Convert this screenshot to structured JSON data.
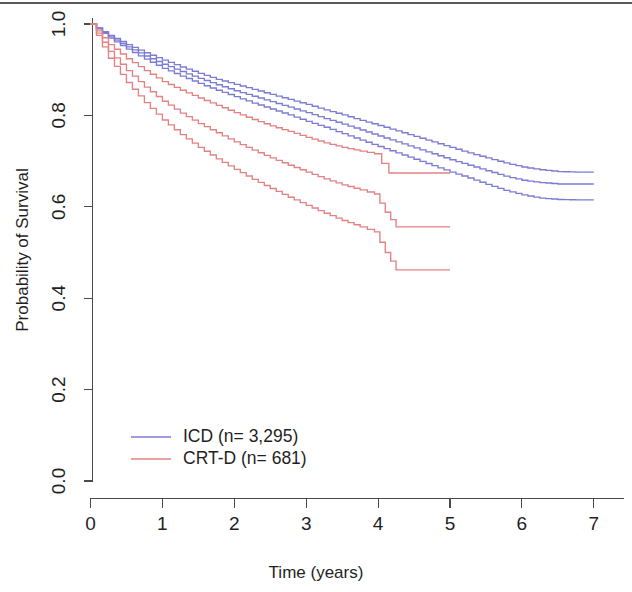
{
  "figure": {
    "title": "",
    "background": "#ffffff"
  },
  "axes": {
    "x_title": "Time (years)",
    "y_title": "Probability of Survival",
    "x_ticks": [
      "0",
      "1",
      "2",
      "3",
      "4",
      "5",
      "6",
      "7"
    ],
    "y_ticks": [
      "0.0",
      "0.2",
      "0.4",
      "0.6",
      "0.8",
      "1.0"
    ]
  },
  "legend": {
    "items": [
      {
        "label": "ICD (n= 3,295)",
        "color": "#7b7bd2"
      },
      {
        "label": "CRT-D (n= 681)",
        "color": "#e28282"
      }
    ]
  },
  "colors": {
    "icd": "#7b7bd2",
    "crtd": "#e28282",
    "axis": "#4a4a4a",
    "text": "#1f1f1f"
  },
  "chart_data": {
    "type": "line",
    "title": "",
    "subtitle": "",
    "xlabel": "Time (years)",
    "ylabel": "Probability of Survival",
    "xlim": [
      0,
      7.1
    ],
    "ylim": [
      0.0,
      1.0
    ],
    "xticks": [
      0,
      1,
      2,
      3,
      4,
      5,
      6,
      7
    ],
    "yticks": [
      0.0,
      0.2,
      0.4,
      0.6,
      0.8,
      1.0
    ],
    "grid": false,
    "legend_position": "lower-left-inside",
    "step_style": "step-post",
    "series": [
      {
        "name": "ICD (n= 3,295)",
        "role": "upper-confidence-limit",
        "color": "#7b7bd2",
        "x": [
          0,
          0.25,
          0.5,
          0.75,
          1.0,
          1.25,
          1.5,
          1.75,
          2.0,
          2.25,
          2.5,
          2.75,
          3.0,
          3.25,
          3.5,
          3.75,
          4.0,
          4.25,
          4.5,
          4.75,
          5.0,
          5.25,
          5.5,
          5.75,
          6.0,
          6.25,
          6.5,
          6.75,
          7.0
        ],
        "y": [
          1.0,
          0.975,
          0.955,
          0.937,
          0.921,
          0.906,
          0.892,
          0.879,
          0.868,
          0.857,
          0.846,
          0.835,
          0.824,
          0.812,
          0.801,
          0.789,
          0.778,
          0.766,
          0.754,
          0.742,
          0.73,
          0.718,
          0.707,
          0.696,
          0.687,
          0.681,
          0.677,
          0.676,
          0.676
        ]
      },
      {
        "name": "ICD (n= 3,295)",
        "role": "estimate",
        "color": "#7b7bd2",
        "x": [
          0,
          0.25,
          0.5,
          0.75,
          1.0,
          1.25,
          1.5,
          1.75,
          2.0,
          2.25,
          2.5,
          2.75,
          3.0,
          3.25,
          3.5,
          3.75,
          4.0,
          4.25,
          4.5,
          4.75,
          5.0,
          5.25,
          5.5,
          5.75,
          6.0,
          6.25,
          6.5,
          6.75,
          7.0
        ],
        "y": [
          1.0,
          0.972,
          0.95,
          0.93,
          0.912,
          0.896,
          0.881,
          0.867,
          0.854,
          0.842,
          0.83,
          0.818,
          0.806,
          0.793,
          0.781,
          0.768,
          0.755,
          0.742,
          0.729,
          0.716,
          0.703,
          0.691,
          0.679,
          0.667,
          0.658,
          0.653,
          0.65,
          0.65,
          0.65
        ]
      },
      {
        "name": "ICD (n= 3,295)",
        "role": "lower-confidence-limit",
        "color": "#7b7bd2",
        "x": [
          0,
          0.25,
          0.5,
          0.75,
          1.0,
          1.25,
          1.5,
          1.75,
          2.0,
          2.25,
          2.5,
          2.75,
          3.0,
          3.25,
          3.5,
          3.75,
          4.0,
          4.25,
          4.5,
          4.75,
          5.0,
          5.25,
          5.5,
          5.75,
          6.0,
          6.25,
          6.5,
          6.75,
          7.0
        ],
        "y": [
          1.0,
          0.969,
          0.945,
          0.923,
          0.903,
          0.886,
          0.87,
          0.855,
          0.841,
          0.827,
          0.814,
          0.801,
          0.787,
          0.774,
          0.76,
          0.746,
          0.732,
          0.718,
          0.704,
          0.69,
          0.676,
          0.663,
          0.649,
          0.636,
          0.626,
          0.619,
          0.616,
          0.615,
          0.615
        ]
      },
      {
        "name": "CRT-D (n= 681)",
        "role": "upper-confidence-limit",
        "color": "#e28282",
        "x": [
          0,
          0.25,
          0.5,
          0.75,
          1.0,
          1.25,
          1.5,
          1.75,
          2.0,
          2.25,
          2.5,
          2.75,
          3.0,
          3.25,
          3.5,
          3.75,
          3.95,
          4.15,
          4.3,
          5.0
        ],
        "y": [
          1.0,
          0.955,
          0.924,
          0.898,
          0.874,
          0.855,
          0.838,
          0.822,
          0.806,
          0.791,
          0.777,
          0.765,
          0.752,
          0.74,
          0.73,
          0.722,
          0.716,
          0.674,
          0.674,
          0.674
        ]
      },
      {
        "name": "CRT-D (n= 681)",
        "role": "estimate",
        "color": "#e28282",
        "x": [
          0,
          0.25,
          0.5,
          0.75,
          1.0,
          1.25,
          1.5,
          1.75,
          2.0,
          2.25,
          2.5,
          2.75,
          3.0,
          3.25,
          3.5,
          3.75,
          3.95,
          4.1,
          4.25,
          5.0
        ],
        "y": [
          1.0,
          0.94,
          0.898,
          0.862,
          0.831,
          0.805,
          0.782,
          0.762,
          0.742,
          0.724,
          0.707,
          0.691,
          0.676,
          0.661,
          0.648,
          0.637,
          0.628,
          0.588,
          0.556,
          0.556
        ]
      },
      {
        "name": "CRT-D (n= 681)",
        "role": "lower-confidence-limit",
        "color": "#e28282",
        "x": [
          0,
          0.25,
          0.5,
          0.75,
          1.0,
          1.25,
          1.5,
          1.75,
          2.0,
          2.25,
          2.5,
          2.75,
          3.0,
          3.25,
          3.5,
          3.75,
          3.95,
          4.1,
          4.25,
          5.0
        ],
        "y": [
          1.0,
          0.925,
          0.872,
          0.828,
          0.79,
          0.758,
          0.73,
          0.705,
          0.682,
          0.66,
          0.64,
          0.621,
          0.603,
          0.586,
          0.57,
          0.556,
          0.545,
          0.5,
          0.462,
          0.462
        ]
      }
    ],
    "annotations": [
      "Red CRT-D curves are truncated at 5 years (follow-up ends).",
      "Blue ICD curves extend to 7 years.",
      "Each group is drawn as three lines: point estimate with upper and lower confidence limits."
    ]
  }
}
